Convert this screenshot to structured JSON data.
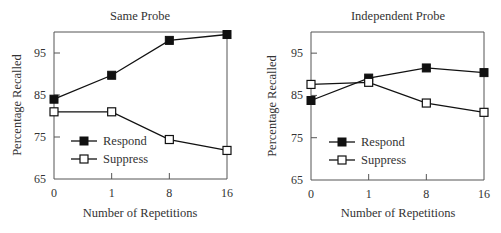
{
  "chart_data": [
    {
      "type": "line",
      "title": "Same Probe",
      "xlabel": "Number of Repetitions",
      "ylabel": "Percentage Recalled",
      "categories": [
        "0",
        "1",
        "8",
        "16"
      ],
      "ylim": [
        65,
        100
      ],
      "yticks": [
        65,
        75,
        85,
        95
      ],
      "grid": false,
      "legend_position": "lower left inside",
      "series": [
        {
          "name": "Respond",
          "marker": "filled-square",
          "values": [
            84,
            89.7,
            98,
            99.4
          ]
        },
        {
          "name": "Suppress",
          "marker": "open-square",
          "values": [
            81,
            81,
            74.4,
            71.8
          ]
        }
      ]
    },
    {
      "type": "line",
      "title": "Independent Probe",
      "xlabel": "Number of Repetitions",
      "ylabel": "Percentage Recalled",
      "categories": [
        "0",
        "1",
        "8",
        "16"
      ],
      "ylim": [
        65,
        100
      ],
      "yticks": [
        65,
        75,
        85,
        95
      ],
      "grid": false,
      "legend_position": "lower left inside",
      "series": [
        {
          "name": "Respond",
          "marker": "filled-square",
          "values": [
            83.8,
            89.1,
            91.5,
            90.4
          ]
        },
        {
          "name": "Suppress",
          "marker": "open-square",
          "values": [
            87.6,
            88.1,
            83.2,
            81
          ]
        }
      ]
    }
  ],
  "charts": [
    {
      "title": "Same Probe",
      "xlabel": "Number of Repetitions",
      "ylabel": "Percentage Recalled",
      "yticks": [
        "65",
        "75",
        "85",
        "95"
      ],
      "xticks": [
        "0",
        "1",
        "8",
        "16"
      ],
      "legend": [
        "Respond",
        "Suppress"
      ]
    },
    {
      "title": "Independent Probe",
      "xlabel": "Number of Repetitions",
      "ylabel": "Percentage Recalled",
      "yticks": [
        "65",
        "75",
        "85",
        "95"
      ],
      "xticks": [
        "0",
        "1",
        "8",
        "16"
      ],
      "legend": [
        "Respond",
        "Suppress"
      ]
    }
  ]
}
